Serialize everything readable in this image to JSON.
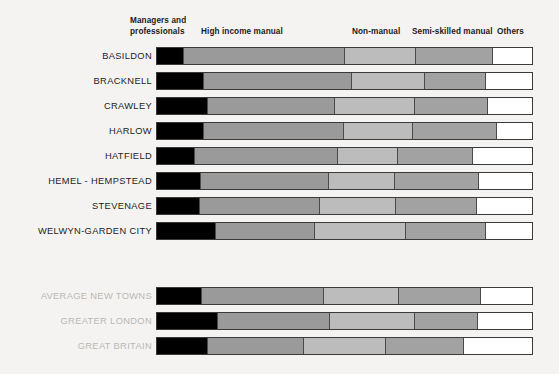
{
  "figure": {
    "background": "#f4f3f1",
    "bar_outline": "#3a3a3a"
  },
  "legend": {
    "position": "top",
    "entries": [
      {
        "label": "Managers and\nprofessionals",
        "color": "#000000",
        "x": 130,
        "y": 16
      },
      {
        "label": "High income manual",
        "color": "#9a9a9a",
        "x": 201,
        "y": 27
      },
      {
        "label": "Non-manual",
        "color": "#bcbcbc",
        "x": 352,
        "y": 27
      },
      {
        "label": "Semi-skilled manual",
        "color": "#a2a2a2",
        "x": 412,
        "y": 27
      },
      {
        "label": "Others",
        "color": "#ffffff",
        "x": 497,
        "y": 27
      }
    ]
  },
  "groups": {
    "towns": [
      {
        "label": "BASILDON",
        "y": 47,
        "muted": false
      },
      {
        "label": "BRACKNELL",
        "y": 72,
        "muted": false
      },
      {
        "label": "CRAWLEY",
        "y": 97,
        "muted": false
      },
      {
        "label": "HARLOW",
        "y": 122,
        "muted": false
      },
      {
        "label": "HATFIELD",
        "y": 147,
        "muted": false
      },
      {
        "label": "HEMEL - HEMPSTEAD",
        "y": 172,
        "muted": false
      },
      {
        "label": "STEVENAGE",
        "y": 197,
        "muted": false
      },
      {
        "label": "WELWYN-GARDEN  CITY",
        "y": 222,
        "muted": false
      }
    ],
    "references": [
      {
        "label": "AVERAGE  NEW  TOWNS",
        "y": 287,
        "muted": true
      },
      {
        "label": "GREATER  LONDON",
        "y": 312,
        "muted": true
      },
      {
        "label": "GREAT  BRITAIN",
        "y": 337,
        "muted": true
      }
    ]
  },
  "chart_data": {
    "type": "bar",
    "orientation": "horizontal",
    "stacked": true,
    "normalized": true,
    "title": "",
    "xlabel": "",
    "ylabel": "",
    "xlim": [
      0,
      100
    ],
    "grid": false,
    "units": "percent of economically active population",
    "categories": [
      "BASILDON",
      "BRACKNELL",
      "CRAWLEY",
      "HARLOW",
      "HATFIELD",
      "HEMEL - HEMPSTEAD",
      "STEVENAGE",
      "WELWYN-GARDEN  CITY",
      "AVERAGE  NEW  TOWNS",
      "GREATER  LONDON",
      "GREAT  BRITAIN"
    ],
    "series": [
      {
        "name": "Managers and professionals",
        "color": "#000000",
        "values": [
          6.9,
          12.2,
          13.3,
          12.2,
          9.8,
          11.4,
          11.1,
          15.4,
          11.7,
          15.9,
          13.3
        ]
      },
      {
        "name": "High income manual",
        "color": "#9a9a9a",
        "values": [
          43.0,
          39.5,
          34.0,
          37.4,
          38.2,
          34.3,
          32.1,
          26.5,
          32.6,
          30.0,
          25.5
        ]
      },
      {
        "name": "Non-manual",
        "color": "#bcbcbc",
        "values": [
          18.8,
          19.4,
          21.2,
          18.3,
          15.9,
          17.5,
          20.4,
          24.1,
          19.9,
          22.5,
          22.0
        ]
      },
      {
        "name": "Semi-skilled manual",
        "color": "#a2a2a2",
        "values": [
          20.7,
          16.4,
          19.6,
          22.5,
          20.2,
          22.3,
          21.5,
          21.5,
          22.0,
          17.0,
          20.7
        ]
      },
      {
        "name": "Others",
        "color": "#ffffff",
        "values": [
          10.6,
          12.5,
          11.9,
          9.6,
          15.9,
          14.5,
          14.9,
          12.5,
          13.8,
          14.6,
          18.5
        ]
      }
    ]
  },
  "geometry": {
    "bar_left": 156,
    "bar_width": 377,
    "bar_height": 18
  }
}
